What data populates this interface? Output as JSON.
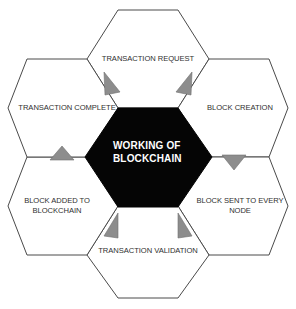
{
  "diagram": {
    "title": "WORKING OF\nBLOCKCHAIN",
    "type": "hexagonal-cycle",
    "colors": {
      "background": "#ffffff",
      "hex_outline": "#4a4a4a",
      "hex_fill": "#ffffff",
      "center_fill": "#050505",
      "center_text": "#ffffff",
      "label_text": "#2f2f2f",
      "arrow_fill": "#8d8d8d"
    },
    "center": {
      "label": "WORKING OF\nBLOCKCHAIN"
    },
    "steps": [
      {
        "order": 1,
        "position": "top",
        "label": "TRANSACTION REQUEST"
      },
      {
        "order": 2,
        "position": "top-right",
        "label": "BLOCK CREATION"
      },
      {
        "order": 3,
        "position": "bottom-right",
        "label": "BLOCK SENT TO EVERY\nNODE"
      },
      {
        "order": 4,
        "position": "bottom",
        "label": "TRANSACTION  VALIDATION"
      },
      {
        "order": 5,
        "position": "bottom-left",
        "label": "BLOCK ADDED TO\nBLOCKCHAIN"
      },
      {
        "order": 6,
        "position": "top-left",
        "label": "TRANSACTION COMPLETE"
      }
    ],
    "arrows": [
      {
        "name": "arrow-top-to-top-right",
        "direction": "down-right"
      },
      {
        "name": "arrow-top-right-to-bottom-right",
        "direction": "down"
      },
      {
        "name": "arrow-bottom-right-to-bottom",
        "direction": "up-left"
      },
      {
        "name": "arrow-bottom-to-bottom-left",
        "direction": "up-left"
      },
      {
        "name": "arrow-bottom-left-to-top-left",
        "direction": "up"
      },
      {
        "name": "arrow-top-left-to-top",
        "direction": "down-left"
      }
    ]
  }
}
